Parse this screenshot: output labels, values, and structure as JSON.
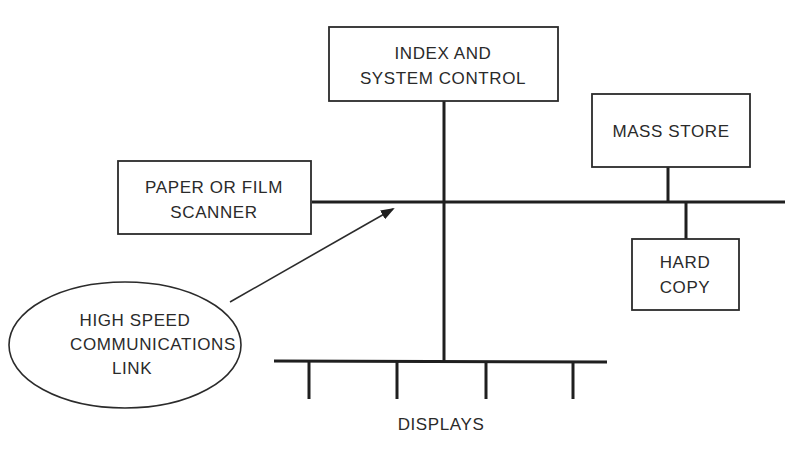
{
  "diagram": {
    "nodes": {
      "index_control": {
        "lines": [
          "INDEX AND",
          "SYSTEM CONTROL"
        ]
      },
      "mass_store": {
        "lines": [
          "MASS STORE"
        ]
      },
      "scanner": {
        "lines": [
          "PAPER OR FILM",
          "SCANNER"
        ]
      },
      "hard_copy": {
        "lines": [
          "HARD",
          "COPY"
        ]
      },
      "comm_link": {
        "lines": [
          "HIGH SPEED",
          "COMMUNICATIONS",
          "LINK"
        ]
      },
      "displays": {
        "label": "DISPLAYS",
        "terminal_count": 4
      }
    },
    "edges": [
      {
        "from": "scanner",
        "to": "main_bus"
      },
      {
        "from": "index_control",
        "to": "main_bus"
      },
      {
        "from": "mass_store",
        "to": "main_bus"
      },
      {
        "from": "hard_copy",
        "to": "main_bus"
      },
      {
        "from": "main_bus",
        "to": "displays_bus"
      },
      {
        "from": "comm_link",
        "to": "main_bus",
        "type": "arrow"
      }
    ],
    "colors": {
      "line": "#1f1f1f",
      "text": "#2a2a2a",
      "background": "#ffffff"
    }
  }
}
